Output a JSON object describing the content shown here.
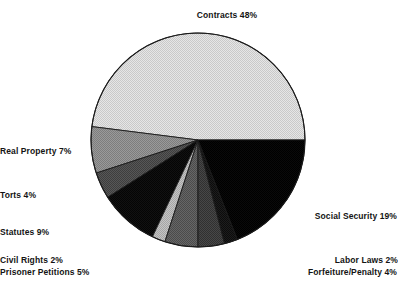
{
  "chart_data": {
    "type": "pie",
    "title": "",
    "subtitle": "",
    "xlabel": "",
    "ylabel": "",
    "legend_position": "none",
    "grid": false,
    "units": "percent",
    "categories": [
      "Contracts",
      "Social Security",
      "Labor Laws",
      "Forfeiture/Penalty",
      "Prisoner Petitions",
      "Civil Rights",
      "Statutes",
      "Torts",
      "Real Property"
    ],
    "values": [
      48,
      19,
      2,
      4,
      5,
      2,
      9,
      4,
      7
    ],
    "slices": [
      {
        "name": "Contracts",
        "label": "Contracts 48%",
        "value": 48,
        "color": "#d9d9d9",
        "start_angle_deg": 0,
        "end_angle_deg": 172.8
      },
      {
        "name": "Real Property",
        "label": "Real Property 7%",
        "value": 7,
        "color": "#8c8c8c",
        "start_angle_deg": 172.8,
        "end_angle_deg": 198.0
      },
      {
        "name": "Torts",
        "label": "Torts 4%",
        "value": 4,
        "color": "#4d4d4d",
        "start_angle_deg": 198.0,
        "end_angle_deg": 212.4
      },
      {
        "name": "Statutes",
        "label": "Statutes 9%",
        "value": 9,
        "color": "#0a0a0a",
        "start_angle_deg": 212.4,
        "end_angle_deg": 244.8
      },
      {
        "name": "Civil Rights",
        "label": "Civil Rights 2%",
        "value": 2,
        "color": "#b5b5b5",
        "start_angle_deg": 244.8,
        "end_angle_deg": 252.0
      },
      {
        "name": "Prisoner Petitions",
        "label": "Prisoner Petitions 5%",
        "value": 5,
        "color": "#5c5c5c",
        "start_angle_deg": 252.0,
        "end_angle_deg": 270.0
      },
      {
        "name": "Forfeiture/Penalty",
        "label": "Forfeiture/Penalty 4%",
        "value": 4,
        "color": "#3d3d3d",
        "start_angle_deg": 270.0,
        "end_angle_deg": 284.4
      },
      {
        "name": "Labor Laws",
        "label": "Labor Laws 2%",
        "value": 2,
        "color": "#161616",
        "start_angle_deg": 284.4,
        "end_angle_deg": 291.6
      },
      {
        "name": "Social Security",
        "label": "Social Security 19%",
        "value": 19,
        "color": "#050505",
        "start_angle_deg": 291.6,
        "end_angle_deg": 360.0
      }
    ],
    "annotations": [
      {
        "name": "contracts",
        "text": "Contracts 48%"
      },
      {
        "name": "real-property",
        "text": "Real Property 7%"
      },
      {
        "name": "torts",
        "text": "Torts 4%"
      },
      {
        "name": "statutes",
        "text": "Statutes 9%"
      },
      {
        "name": "civil-rights",
        "text": "Civil Rights 2%"
      },
      {
        "name": "prisoner-petitions",
        "text": "Prisoner Petitions 5%"
      },
      {
        "name": "labor-laws",
        "text": "Labor Laws 2%"
      },
      {
        "name": "forfeiture-penalty",
        "text": "Forfeiture/Penalty 4%"
      },
      {
        "name": "social-security",
        "text": "Social Security 19%"
      }
    ],
    "geometry": {
      "center_x": 198,
      "center_y": 140,
      "radius": 107,
      "outline_color": "#000000"
    }
  }
}
